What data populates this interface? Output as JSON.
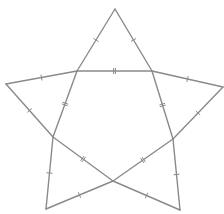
{
  "figure": {
    "type": "star-with-inner-pentagon",
    "background": "#ffffff",
    "stroke_color": "#8a8a8a",
    "tick_color": "#8a8a8a",
    "vertices": {
      "top": [
        115,
        9
      ],
      "inner_top_left": [
        77,
        71
      ],
      "inner_top_right": [
        152,
        71
      ],
      "left": [
        6,
        84
      ],
      "right": [
        223,
        87
      ],
      "inner_left": [
        53,
        137
      ],
      "inner_right": [
        173,
        139
      ],
      "bottom_left": [
        46,
        209
      ],
      "bottom_right": [
        180,
        210
      ],
      "inner_bottom": [
        113,
        181
      ]
    },
    "segments": [
      {
        "from": "top",
        "to": "inner_top_left",
        "ticks": 1
      },
      {
        "from": "top",
        "to": "inner_top_right",
        "ticks": 1
      },
      {
        "from": "inner_top_left",
        "to": "inner_top_right",
        "ticks": 2
      },
      {
        "from": "left",
        "to": "inner_top_left",
        "ticks": 1
      },
      {
        "from": "inner_top_right",
        "to": "right",
        "ticks": 1
      },
      {
        "from": "left",
        "to": "inner_left",
        "ticks": 1
      },
      {
        "from": "right",
        "to": "inner_right",
        "ticks": 1
      },
      {
        "from": "inner_top_left",
        "to": "inner_left",
        "ticks": 2
      },
      {
        "from": "inner_top_right",
        "to": "inner_right",
        "ticks": 2
      },
      {
        "from": "inner_left",
        "to": "bottom_left",
        "ticks": 1
      },
      {
        "from": "inner_right",
        "to": "bottom_right",
        "ticks": 1
      },
      {
        "from": "inner_left",
        "to": "inner_bottom",
        "ticks": 2
      },
      {
        "from": "inner_right",
        "to": "inner_bottom",
        "ticks": 2
      },
      {
        "from": "bottom_left",
        "to": "inner_bottom",
        "ticks": 1
      },
      {
        "from": "inner_bottom",
        "to": "bottom_right",
        "ticks": 1
      }
    ]
  }
}
